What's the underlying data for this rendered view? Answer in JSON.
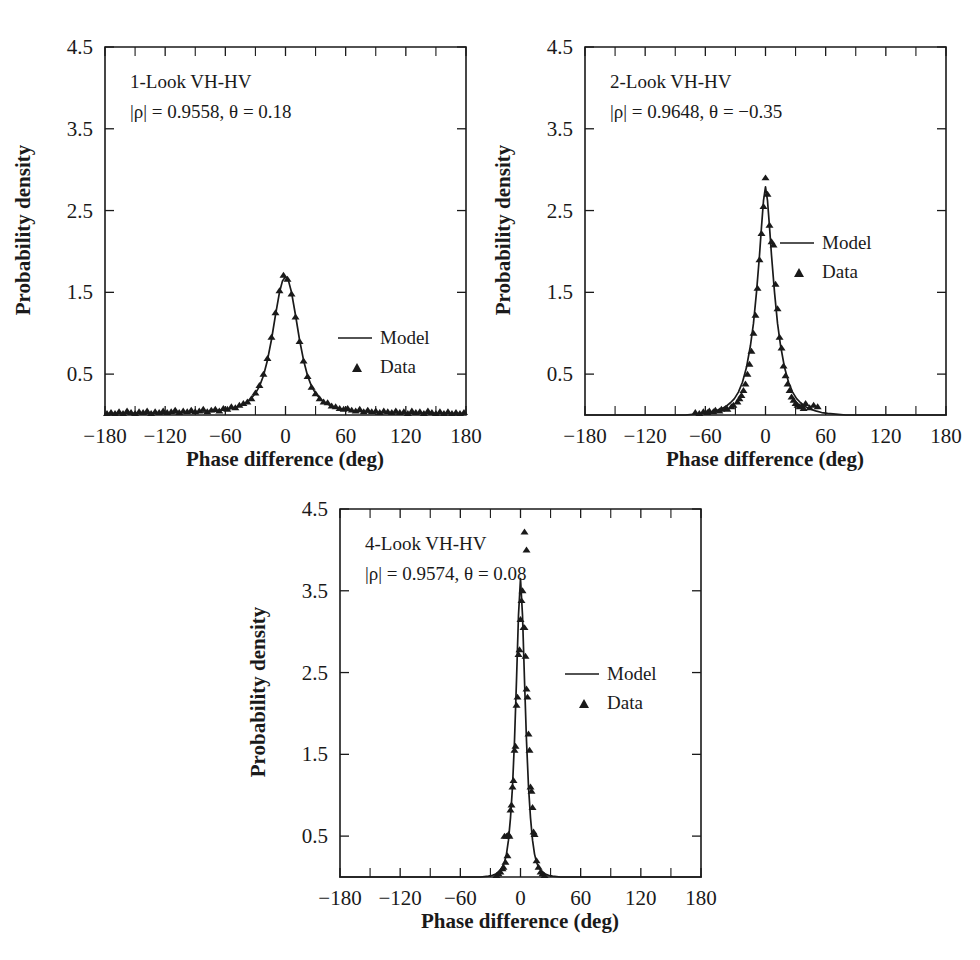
{
  "figure": {
    "background": "#ffffff",
    "ink": "#1a1a1a",
    "panel_count": 3
  },
  "labels": {
    "xlabel": "Phase difference (deg)",
    "ylabel": "Probability density",
    "legend_model": "Model",
    "legend_data": "Data",
    "xticks": [
      "-180",
      "-120",
      "-60",
      "0",
      "60",
      "120",
      "180"
    ],
    "yticks": [
      "0.5",
      "1.5",
      "2.5",
      "3.5",
      "4.5"
    ]
  },
  "panels": [
    {
      "id": "panel-1-look",
      "title": "1-Look VH-HV",
      "params": "|ρ| = 0.9558, θ = 0.18",
      "rho": "0.9558",
      "theta": "0.18"
    },
    {
      "id": "panel-2-look",
      "title": "2-Look VH-HV",
      "params": "|ρ| = 0.9648, θ = −0.35",
      "rho": "0.9648",
      "theta": "−0.35"
    },
    {
      "id": "panel-4-look",
      "title": "4-Look VH-HV",
      "params": "|ρ| = 0.9574, θ = 0.08",
      "rho": "0.9574",
      "theta": "0.08"
    }
  ],
  "chart_data": [
    {
      "type": "line",
      "title": "1-Look VH-HV",
      "subtitle": "|ρ| = 0.9558, θ = 0.18",
      "xlabel": "Phase difference (deg)",
      "ylabel": "Probability density",
      "xlim": [
        -180,
        180
      ],
      "ylim": [
        0,
        4.5
      ],
      "xticks": [
        -180,
        -120,
        -60,
        0,
        60,
        120,
        180
      ],
      "yticks": [
        0.5,
        1.5,
        2.5,
        3.5,
        4.5
      ],
      "grid": false,
      "legend_position": "center-right",
      "series": [
        {
          "name": "Model",
          "kind": "line",
          "x": [
            -180,
            -170,
            -160,
            -150,
            -140,
            -130,
            -120,
            -110,
            -100,
            -90,
            -80,
            -70,
            -60,
            -55,
            -50,
            -45,
            -40,
            -35,
            -30,
            -26,
            -22,
            -18,
            -14,
            -10,
            -6,
            -3,
            0,
            3,
            6,
            10,
            14,
            18,
            22,
            26,
            30,
            35,
            40,
            45,
            50,
            55,
            60,
            70,
            80,
            90,
            100,
            110,
            120,
            130,
            140,
            150,
            160,
            170,
            180
          ],
          "y": [
            0.018,
            0.018,
            0.019,
            0.02,
            0.021,
            0.022,
            0.024,
            0.026,
            0.029,
            0.033,
            0.039,
            0.048,
            0.064,
            0.076,
            0.092,
            0.114,
            0.146,
            0.192,
            0.264,
            0.35,
            0.48,
            0.67,
            0.92,
            1.22,
            1.5,
            1.64,
            1.69,
            1.64,
            1.5,
            1.22,
            0.92,
            0.67,
            0.48,
            0.35,
            0.264,
            0.192,
            0.146,
            0.114,
            0.092,
            0.076,
            0.064,
            0.048,
            0.039,
            0.033,
            0.029,
            0.026,
            0.024,
            0.022,
            0.021,
            0.02,
            0.019,
            0.018,
            0.018
          ]
        },
        {
          "name": "Data",
          "kind": "scatter",
          "x": [
            -178,
            -174,
            -170,
            -166,
            -162,
            -158,
            -154,
            -150,
            -146,
            -142,
            -138,
            -134,
            -130,
            -126,
            -122,
            -118,
            -114,
            -110,
            -106,
            -102,
            -98,
            -94,
            -90,
            -86,
            -82,
            -78,
            -74,
            -70,
            -66,
            -62,
            -58,
            -54,
            -50,
            -46,
            -42,
            -38,
            -34,
            -30,
            -26,
            -22,
            -18,
            -14,
            -10,
            -6,
            -2,
            2,
            6,
            10,
            14,
            18,
            22,
            26,
            30,
            34,
            38,
            42,
            46,
            50,
            54,
            58,
            62,
            66,
            70,
            74,
            78,
            82,
            86,
            90,
            94,
            98,
            102,
            106,
            110,
            114,
            118,
            122,
            126,
            130,
            134,
            138,
            142,
            146,
            150,
            154,
            158,
            162,
            166,
            170,
            174,
            178
          ],
          "y": [
            0.02,
            0.03,
            0.02,
            0.04,
            0.02,
            0.05,
            0.03,
            0.02,
            0.04,
            0.03,
            0.05,
            0.02,
            0.04,
            0.03,
            0.05,
            0.03,
            0.04,
            0.06,
            0.03,
            0.05,
            0.04,
            0.06,
            0.04,
            0.05,
            0.07,
            0.04,
            0.06,
            0.07,
            0.05,
            0.08,
            0.07,
            0.1,
            0.09,
            0.12,
            0.14,
            0.16,
            0.2,
            0.27,
            0.36,
            0.5,
            0.69,
            0.95,
            1.25,
            1.52,
            1.71,
            1.66,
            1.48,
            1.2,
            0.9,
            0.66,
            0.47,
            0.34,
            0.26,
            0.2,
            0.16,
            0.15,
            0.11,
            0.1,
            0.08,
            0.07,
            0.08,
            0.06,
            0.05,
            0.07,
            0.04,
            0.06,
            0.04,
            0.05,
            0.03,
            0.05,
            0.04,
            0.03,
            0.05,
            0.03,
            0.04,
            0.02,
            0.05,
            0.03,
            0.04,
            0.02,
            0.05,
            0.03,
            0.02,
            0.04,
            0.02,
            0.04,
            0.02,
            0.03,
            0.02,
            0.03
          ]
        }
      ]
    },
    {
      "type": "line",
      "title": "2-Look VH-HV",
      "subtitle": "|ρ| = 0.9648, θ = −0.35",
      "xlabel": "Phase difference (deg)",
      "ylabel": "Probability density",
      "xlim": [
        -180,
        180
      ],
      "ylim": [
        0,
        4.5
      ],
      "xticks": [
        -180,
        -120,
        -60,
        0,
        60,
        120,
        180
      ],
      "yticks": [
        0.5,
        1.5,
        2.5,
        3.5,
        4.5
      ],
      "grid": false,
      "legend_position": "center-right",
      "series": [
        {
          "name": "Model",
          "kind": "line",
          "x": [
            -180,
            -150,
            -120,
            -100,
            -90,
            -80,
            -70,
            -62,
            -56,
            -50,
            -45,
            -40,
            -35,
            -31,
            -27,
            -23,
            -19,
            -15,
            -12,
            -9,
            -6,
            -4,
            -2,
            0,
            2,
            4,
            6,
            9,
            12,
            15,
            19,
            23,
            27,
            31,
            35,
            40,
            45,
            50,
            56,
            62,
            70,
            80,
            90,
            100,
            120,
            150,
            180
          ],
          "y": [
            0.0,
            0.0,
            0.0,
            0.0,
            0.0,
            0.0,
            0.01,
            0.02,
            0.03,
            0.05,
            0.07,
            0.1,
            0.15,
            0.2,
            0.28,
            0.4,
            0.58,
            0.85,
            1.12,
            1.5,
            1.95,
            2.3,
            2.62,
            2.79,
            2.62,
            2.3,
            1.95,
            1.5,
            1.12,
            0.85,
            0.58,
            0.4,
            0.28,
            0.2,
            0.15,
            0.1,
            0.07,
            0.05,
            0.03,
            0.02,
            0.01,
            0.0,
            0.0,
            0.0,
            0.0,
            0.0,
            0.0
          ]
        },
        {
          "name": "Data",
          "kind": "scatter",
          "x": [
            -70,
            -66,
            -62,
            -58,
            -56,
            -52,
            -50,
            -46,
            -44,
            -40,
            -38,
            -34,
            -32,
            -28,
            -26,
            -24,
            -22,
            -20,
            -18,
            -16,
            -14,
            -12,
            -10,
            -8,
            -6,
            -4,
            -2,
            0,
            2,
            4,
            6,
            8,
            10,
            12,
            14,
            16,
            18,
            20,
            22,
            24,
            26,
            28,
            30,
            32,
            34,
            36,
            38,
            40,
            44,
            48,
            52
          ],
          "y": [
            0.03,
            0.02,
            0.04,
            0.03,
            0.05,
            0.04,
            0.06,
            0.05,
            0.07,
            0.08,
            0.07,
            0.1,
            0.12,
            0.16,
            0.2,
            0.24,
            0.3,
            0.38,
            0.5,
            0.62,
            0.78,
            1.0,
            1.22,
            1.55,
            1.9,
            2.22,
            2.55,
            2.9,
            2.7,
            2.32,
            2.12,
            2.08,
            1.6,
            1.3,
            0.95,
            0.82,
            0.6,
            0.48,
            0.38,
            0.3,
            0.22,
            0.18,
            0.14,
            0.12,
            0.1,
            0.11,
            0.08,
            0.14,
            0.09,
            0.12,
            0.1
          ]
        }
      ]
    },
    {
      "type": "line",
      "title": "4-Look VH-HV",
      "subtitle": "|ρ| = 0.9574, θ = 0.08",
      "xlabel": "Phase difference (deg)",
      "ylabel": "Probability density",
      "xlim": [
        -180,
        180
      ],
      "ylim": [
        0,
        4.5
      ],
      "xticks": [
        -180,
        -120,
        -60,
        0,
        60,
        120,
        180
      ],
      "yticks": [
        0.5,
        1.5,
        2.5,
        3.5,
        4.5
      ],
      "grid": false,
      "legend_position": "center-right",
      "series": [
        {
          "name": "Model",
          "kind": "line",
          "x": [
            -180,
            -120,
            -60,
            -40,
            -32,
            -28,
            -24,
            -21,
            -18,
            -16,
            -14,
            -12,
            -10,
            -8,
            -6,
            -4,
            -2,
            0,
            2,
            4,
            6,
            8,
            10,
            12,
            14,
            16,
            18,
            21,
            24,
            28,
            32,
            40,
            60,
            120,
            180
          ],
          "y": [
            0.0,
            0.0,
            0.0,
            0.0,
            0.01,
            0.02,
            0.04,
            0.07,
            0.12,
            0.18,
            0.28,
            0.45,
            0.72,
            1.1,
            1.66,
            2.4,
            3.2,
            3.65,
            3.2,
            2.4,
            1.66,
            1.1,
            0.72,
            0.45,
            0.28,
            0.18,
            0.12,
            0.07,
            0.04,
            0.02,
            0.01,
            0.0,
            0.0,
            0.0,
            0.0
          ]
        },
        {
          "name": "Data",
          "kind": "scatter",
          "x": [
            -24,
            -22,
            -20,
            -18,
            -17,
            -16,
            -15,
            -14,
            -13,
            -12,
            -11,
            -10,
            -9,
            -8,
            -7,
            -6,
            -5,
            -4,
            -3,
            -2,
            -1,
            0,
            1,
            2,
            3,
            4,
            5,
            6,
            7,
            8,
            9,
            10,
            11,
            12,
            13,
            14,
            16,
            18,
            20,
            22,
            24,
            4,
            6
          ],
          "y": [
            0.02,
            0.04,
            0.06,
            0.1,
            0.12,
            0.5,
            0.18,
            0.5,
            0.26,
            0.52,
            0.5,
            0.82,
            0.88,
            1.1,
            1.18,
            1.55,
            1.6,
            2.1,
            2.2,
            2.72,
            2.78,
            3.15,
            3.38,
            3.5,
            3.05,
            3.05,
            2.7,
            2.3,
            2.2,
            1.75,
            1.55,
            1.1,
            1.05,
            0.85,
            0.55,
            0.52,
            0.2,
            0.12,
            0.06,
            0.04,
            0.02,
            4.22,
            4.0
          ]
        }
      ]
    }
  ]
}
